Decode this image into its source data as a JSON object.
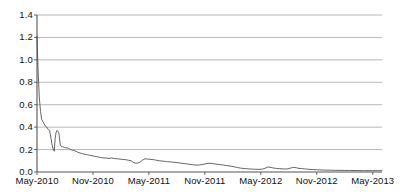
{
  "chart_data": {
    "type": "line",
    "title": "",
    "subtitle": "",
    "xlabel": "",
    "ylabel": "",
    "grid": "horizontal",
    "legend": "none",
    "ylim": [
      0.0,
      1.4
    ],
    "ytick_labels": [
      "0.0",
      "0.2",
      "0.4",
      "0.6",
      "0.8",
      "1.0",
      "1.2",
      "1.4"
    ],
    "ytick_values": [
      0.0,
      0.2,
      0.4,
      0.6,
      0.8,
      1.0,
      1.2,
      1.4
    ],
    "xtick_labels": [
      "May-2010",
      "Nov-2010",
      "May-2011",
      "Nov-2011",
      "May-2012",
      "Nov-2012",
      "May-2013"
    ],
    "xtick_values": [
      0,
      6,
      12,
      18,
      24,
      30,
      36
    ],
    "xlim": [
      0,
      37
    ],
    "line_color": "#4a4a4a",
    "grid_color": "#9a9a9a",
    "background_color": "#ffffff",
    "series": [
      {
        "name": "series-1",
        "x": [
          0.0,
          0.12,
          0.25,
          0.38,
          0.5,
          0.62,
          0.75,
          0.9,
          1.05,
          1.2,
          1.35,
          1.5,
          1.62,
          1.75,
          1.85,
          1.95,
          2.05,
          2.15,
          2.25,
          2.35,
          2.5,
          2.65,
          2.8,
          2.95,
          3.1,
          3.25,
          3.4,
          3.6,
          3.8,
          4.0,
          4.2,
          4.4,
          4.6,
          4.8,
          5.0,
          5.3,
          5.6,
          5.9,
          6.2,
          6.5,
          6.8,
          7.1,
          7.4,
          7.7,
          8.0,
          8.3,
          8.6,
          8.9,
          9.2,
          9.5,
          9.8,
          10.1,
          10.4,
          10.7,
          11.0,
          11.3,
          11.6,
          11.9,
          12.2,
          12.5,
          12.8,
          13.1,
          13.4,
          13.7,
          14.0,
          14.3,
          14.6,
          14.9,
          15.2,
          15.5,
          15.8,
          16.1,
          16.4,
          16.7,
          17.0,
          17.3,
          17.6,
          17.9,
          18.2,
          18.5,
          18.8,
          19.1,
          19.4,
          19.7,
          20.0,
          20.3,
          20.6,
          20.9,
          21.2,
          21.5,
          21.8,
          22.1,
          22.4,
          22.7,
          23.0,
          23.3,
          23.6,
          23.9,
          24.2,
          24.5,
          24.8,
          25.1,
          25.4,
          25.7,
          26.0,
          26.3,
          26.6,
          26.9,
          27.2,
          27.5,
          27.8,
          28.1,
          28.4,
          28.7,
          29.0,
          29.5,
          30.0,
          30.5,
          31.0,
          31.5,
          32.0,
          32.5,
          33.0,
          33.5,
          34.0,
          34.5,
          35.0,
          35.5,
          36.0,
          36.5,
          37.0
        ],
        "y": [
          1.21,
          0.9,
          0.66,
          0.54,
          0.47,
          0.45,
          0.43,
          0.41,
          0.4,
          0.38,
          0.37,
          0.3,
          0.24,
          0.2,
          0.185,
          0.3,
          0.355,
          0.37,
          0.36,
          0.345,
          0.24,
          0.225,
          0.225,
          0.22,
          0.215,
          0.215,
          0.21,
          0.2,
          0.195,
          0.19,
          0.185,
          0.175,
          0.17,
          0.165,
          0.16,
          0.155,
          0.15,
          0.145,
          0.14,
          0.135,
          0.13,
          0.125,
          0.125,
          0.12,
          0.125,
          0.12,
          0.118,
          0.115,
          0.112,
          0.11,
          0.105,
          0.1,
          0.082,
          0.078,
          0.085,
          0.105,
          0.118,
          0.115,
          0.112,
          0.11,
          0.105,
          0.1,
          0.098,
          0.095,
          0.092,
          0.09,
          0.088,
          0.085,
          0.082,
          0.078,
          0.075,
          0.072,
          0.068,
          0.065,
          0.062,
          0.062,
          0.065,
          0.07,
          0.075,
          0.078,
          0.075,
          0.072,
          0.068,
          0.065,
          0.062,
          0.058,
          0.055,
          0.05,
          0.045,
          0.04,
          0.035,
          0.032,
          0.03,
          0.028,
          0.026,
          0.025,
          0.024,
          0.024,
          0.026,
          0.035,
          0.045,
          0.04,
          0.035,
          0.032,
          0.03,
          0.028,
          0.027,
          0.028,
          0.035,
          0.042,
          0.038,
          0.032,
          0.03,
          0.028,
          0.025,
          0.022,
          0.02,
          0.018,
          0.017,
          0.016,
          0.015,
          0.015,
          0.014,
          0.014,
          0.013,
          0.013,
          0.012,
          0.012,
          0.012,
          0.012,
          0.012
        ]
      }
    ]
  }
}
